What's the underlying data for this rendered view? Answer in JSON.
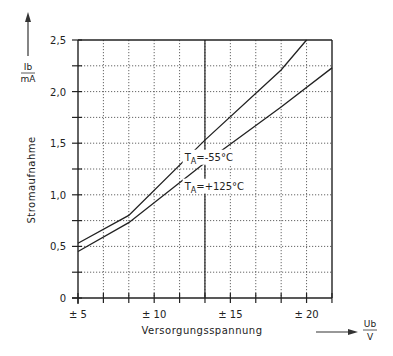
{
  "chart_data": {
    "type": "line",
    "title": "",
    "xlabel": "Versorgungsspannung",
    "xunit": {
      "numerator": "Ub",
      "denominator": "V"
    },
    "ylabel": "Stromaufnahme",
    "yunit": {
      "numerator": "Ib",
      "denominator": "mA"
    },
    "xlim": [
      5,
      21.67
    ],
    "ylim": [
      0,
      2.5
    ],
    "xticks": [
      {
        "value": 5,
        "label": "± 5"
      },
      {
        "value": 10,
        "label": "± 10"
      },
      {
        "value": 15,
        "label": "± 15"
      },
      {
        "value": 20,
        "label": "± 20"
      }
    ],
    "xminor_step": 1.6667,
    "yticks": [
      {
        "value": 0,
        "label": "0"
      },
      {
        "value": 0.5,
        "label": "0,5"
      },
      {
        "value": 1.0,
        "label": "1,0"
      },
      {
        "value": 1.5,
        "label": "1,5"
      },
      {
        "value": 2.0,
        "label": "2,0"
      },
      {
        "value": 2.5,
        "label": "2,5"
      }
    ],
    "yminor_step": 0.25,
    "grid": true,
    "grid_style": "dotted",
    "reference_line_x": 13.33,
    "series": [
      {
        "name": "T_A = -55°C",
        "label_main": "T",
        "label_sub": "A",
        "label_rest": "=-55°C",
        "label_pos": {
          "x": 12.0,
          "y": 1.33
        },
        "points": [
          [
            5,
            0.53
          ],
          [
            8.33,
            0.8
          ],
          [
            13.33,
            1.53
          ],
          [
            18.33,
            2.21
          ],
          [
            20.0,
            2.5
          ]
        ]
      },
      {
        "name": "T_A = +125°C",
        "label_main": "T",
        "label_sub": "A",
        "label_rest": "=+125°C",
        "label_pos": {
          "x": 12.0,
          "y": 1.05
        },
        "points": [
          [
            5,
            0.45
          ],
          [
            8.33,
            0.73
          ],
          [
            13.33,
            1.31
          ],
          [
            18.33,
            1.85
          ],
          [
            21.67,
            2.23
          ]
        ]
      }
    ]
  }
}
